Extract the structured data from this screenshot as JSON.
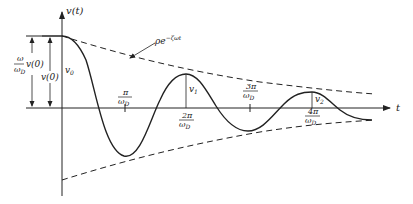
{
  "diagram": {
    "axes": {
      "y_label": "v(t)",
      "x_label": "t"
    },
    "envelope_label": "ρe^{-ζωt}",
    "envelope_label_text": "ρe",
    "envelope_label_exp": "−ζωt",
    "left_dimensions": [
      {
        "num": "ω",
        "den": "ω",
        "den_sub": "D",
        "suffix": "v(0)"
      },
      {
        "text": "v(0)"
      }
    ],
    "curve_labels": {
      "v0": {
        "base": "v",
        "sub": "0"
      },
      "v1": {
        "base": "v",
        "sub": "1"
      },
      "v2": {
        "base": "v",
        "sub": "2"
      }
    },
    "ticks": [
      {
        "num": "π",
        "den": "ω",
        "den_sub": "D",
        "position": "above"
      },
      {
        "num": "2π",
        "den": "ω",
        "den_sub": "D",
        "position": "below"
      },
      {
        "num": "3π",
        "den": "ω",
        "den_sub": "D",
        "position": "above"
      },
      {
        "num": "4π",
        "den": "ω",
        "den_sub": "D",
        "position": "below"
      }
    ],
    "colors": {
      "line": "#222222",
      "background": "#ffffff"
    }
  }
}
